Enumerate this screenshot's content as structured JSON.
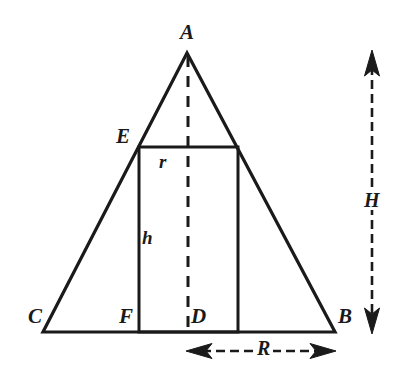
{
  "figure": {
    "kind": "geometry-diagram",
    "stroke_color": "#1a1a1a",
    "background_color": "#ffffff",
    "vertex_labels": [
      {
        "id": "A",
        "text": "A",
        "x": 180,
        "y": 22,
        "role": "apex"
      },
      {
        "id": "B",
        "text": "B",
        "x": 338,
        "y": 306,
        "role": "base-right"
      },
      {
        "id": "C",
        "text": "C",
        "x": 28,
        "y": 306,
        "role": "base-left"
      },
      {
        "id": "D",
        "text": "D",
        "x": 191,
        "y": 306,
        "role": "base-midpoint"
      },
      {
        "id": "E",
        "text": "E",
        "x": 116,
        "y": 126,
        "role": "rectangle-top-left-on-side"
      },
      {
        "id": "F",
        "text": "F",
        "x": 119,
        "y": 306,
        "role": "rectangle-bottom-left-on-base"
      }
    ],
    "dimension_labels": [
      {
        "id": "H",
        "text": "H",
        "x": 361,
        "y": 190,
        "meaning": "full height of triangle"
      },
      {
        "id": "R",
        "text": "R",
        "x": 254,
        "y": 338,
        "meaning": "base half-width / radius"
      },
      {
        "id": "h",
        "text": "h",
        "x": 142,
        "y": 228,
        "meaning": "height of inscribed rectangle"
      },
      {
        "id": "r",
        "text": "r",
        "x": 159,
        "y": 152,
        "meaning": "half-width of inscribed rectangle"
      }
    ],
    "geometry": {
      "apex": {
        "x": 187,
        "y": 52
      },
      "base_left": {
        "x": 43,
        "y": 332
      },
      "base_right": {
        "x": 335,
        "y": 332
      },
      "base_midpoint": {
        "x": 188,
        "y": 332
      },
      "rectangle": {
        "left": 139,
        "right": 238,
        "top": 147,
        "bottom": 332
      },
      "axis_dashed": {
        "x": 188,
        "y_top": 55,
        "y_bottom": 332
      },
      "height_arrow": {
        "x": 372,
        "y_top": 52,
        "y_bottom": 332
      },
      "radius_arrow": {
        "y": 351,
        "x_left": 188,
        "x_right": 334
      }
    }
  }
}
